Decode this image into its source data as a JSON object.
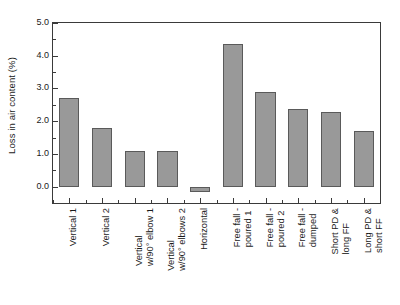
{
  "chart_data": {
    "type": "bar",
    "title": "",
    "xlabel": "",
    "ylabel": "Loss in air content (%)",
    "ylim": [
      -0.5,
      5.0
    ],
    "ytick_values": [
      0.0,
      1.0,
      2.0,
      3.0,
      4.0,
      5.0
    ],
    "ytick_labels": [
      "0.0",
      "1.0",
      "2.0",
      "3.0",
      "4.0",
      "5.0"
    ],
    "yminor_values": [
      0.5,
      1.5,
      2.5,
      3.5,
      4.5
    ],
    "grid": false,
    "legend": null,
    "bar_color": "#999999",
    "bar_edge_color": "#5a5a5a",
    "axis_color": "#3a3a3a",
    "categories": [
      "Vertical 1",
      "Vertical 2",
      "Vertical w/90° elbow 1",
      "Vertical w/90° elbows 2",
      "Horizontal",
      "Free fall - poured 1",
      "Free fall - poured 2",
      "Free fall - dumped",
      "Short PD & long FF",
      "Long PD & short FF"
    ],
    "category_lines": [
      [
        "Vertical 1",
        ""
      ],
      [
        "Vertical 2",
        ""
      ],
      [
        "Vertical",
        "w/90° elbow 1"
      ],
      [
        "Vertical",
        "w/90° elbows 2"
      ],
      [
        "Horizontal",
        ""
      ],
      [
        "Free fall -",
        "poured 1"
      ],
      [
        "Free fall -",
        "poured 2"
      ],
      [
        "Free fall -",
        "dumped"
      ],
      [
        "Short PD &",
        "long FF"
      ],
      [
        "Long PD &",
        "short FF"
      ]
    ],
    "values": [
      2.7,
      1.8,
      1.1,
      1.1,
      -0.15,
      4.35,
      2.9,
      2.38,
      2.28,
      1.7
    ]
  }
}
